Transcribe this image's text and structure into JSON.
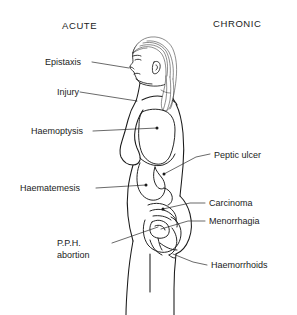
{
  "figure": {
    "background_color": "#ffffff",
    "ink_color": "#1a1a1a",
    "width": 297,
    "height": 315
  },
  "headings": {
    "left": "ACUTE",
    "right": "CHRONIC"
  },
  "labels_left": [
    {
      "id": "epistaxis",
      "text": "Epistaxis",
      "target": "nose"
    },
    {
      "id": "injury",
      "text": "Injury",
      "target": "neck-shoulder"
    },
    {
      "id": "haemoptysis",
      "text": "Haemoptysis",
      "target": "lung"
    },
    {
      "id": "haematemesis",
      "text": "Haematemesis",
      "target": "stomach"
    },
    {
      "id": "pph-abortion",
      "text": "P.P.H.",
      "text2": "abortion",
      "target": "uterus"
    }
  ],
  "labels_right": [
    {
      "id": "peptic-ulcer",
      "text": "Peptic ulcer",
      "target": "duodenum"
    },
    {
      "id": "carcinoma",
      "text": "Carcinoma",
      "target": "bowel"
    },
    {
      "id": "menorrhagia",
      "text": "Menorrhagia",
      "target": "uterus"
    },
    {
      "id": "haemorrhoids",
      "text": "Haemorrhoids",
      "target": "anus"
    }
  ]
}
